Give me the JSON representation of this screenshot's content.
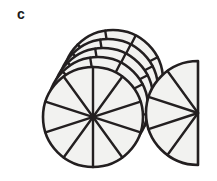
{
  "figure": {
    "panel_label": "c",
    "title": "",
    "caption": "",
    "background_color": "#ffffff",
    "stroke_color": "#231f20",
    "fill_color": "#f2f2f0",
    "canvas": {
      "width": 217,
      "height": 181
    }
  },
  "chart_data": {
    "type": "pie",
    "title": "",
    "subtitle": "",
    "xlabel": "",
    "ylabel": "",
    "legend": [],
    "annotations": [
      "c"
    ],
    "grid": false,
    "sectors_per_whole": 10,
    "sector_angle_degrees": 36,
    "whole_units": 5,
    "partial_unit_sectors": 5,
    "total_sectors": 55,
    "value_as_fraction": "55/10",
    "value_as_mixed_number": "5 1/2",
    "value_as_decimal": 5.5,
    "categories": [
      "whole circle 1",
      "whole circle 2",
      "whole circle 3",
      "whole circle 4",
      "whole circle 5",
      "half circle"
    ],
    "values": [
      10,
      10,
      10,
      10,
      10,
      5
    ],
    "ylim": [
      0,
      10
    ],
    "shapes": [
      {
        "id": "back-circle-4",
        "kind": "circle",
        "cx": 113,
        "cy": 80,
        "r": 50,
        "sectors": 10,
        "rotation_deg": -9
      },
      {
        "id": "back-circle-3",
        "kind": "circle",
        "cx": 108,
        "cy": 89,
        "r": 50,
        "sectors": 10,
        "rotation_deg": -9
      },
      {
        "id": "back-circle-2",
        "cx": 103,
        "cy": 98,
        "kind": "circle",
        "r": 50,
        "sectors": 10,
        "rotation_deg": -9
      },
      {
        "id": "back-circle-1",
        "kind": "circle",
        "cx": 98,
        "cy": 107,
        "r": 50,
        "sectors": 10,
        "rotation_deg": -9
      },
      {
        "id": "front-circle",
        "kind": "circle",
        "cx": 93,
        "cy": 117,
        "r": 50,
        "sectors": 10,
        "rotation_deg": 0
      },
      {
        "id": "half-circle",
        "kind": "semicircle",
        "cx": 198,
        "cy": 113,
        "r": 52,
        "sectors": 5,
        "start_deg": -90,
        "end_deg": 90
      }
    ]
  }
}
